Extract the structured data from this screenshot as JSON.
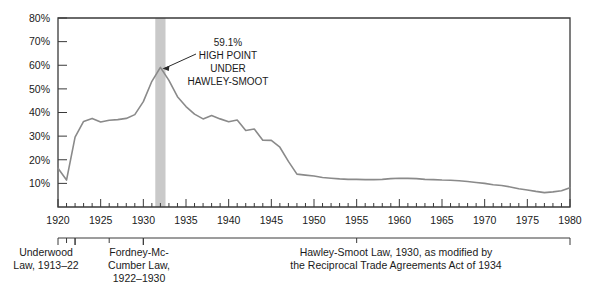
{
  "chart_data": {
    "type": "line",
    "title": "",
    "xlabel": "",
    "ylabel": "",
    "xlim": [
      1920,
      1980
    ],
    "ylim": [
      0,
      80
    ],
    "grid": false,
    "legend": "none",
    "y_ticks": [
      "10%",
      "20%",
      "30%",
      "40%",
      "50%",
      "60%",
      "70%",
      "80%"
    ],
    "y_tick_values": [
      10,
      20,
      30,
      40,
      50,
      60,
      70,
      80
    ],
    "x_ticks": [
      "1920",
      "1925",
      "1930",
      "1935",
      "1940",
      "1945",
      "1950",
      "1955",
      "1960",
      "1965",
      "1970",
      "1975",
      "1980"
    ],
    "x_tick_values": [
      1920,
      1925,
      1930,
      1935,
      1940,
      1945,
      1950,
      1955,
      1960,
      1965,
      1970,
      1975,
      1980
    ],
    "series": [
      {
        "name": "Average tariff rate on dutiable imports",
        "color": "#8a8a8a",
        "x": [
          1920,
          1921,
          1922,
          1923,
          1924,
          1925,
          1926,
          1927,
          1928,
          1929,
          1930,
          1931,
          1932,
          1933,
          1934,
          1935,
          1936,
          1937,
          1938,
          1939,
          1940,
          1941,
          1942,
          1943,
          1944,
          1945,
          1946,
          1947,
          1948,
          1949,
          1950,
          1951,
          1952,
          1953,
          1954,
          1955,
          1956,
          1957,
          1958,
          1959,
          1960,
          1961,
          1962,
          1963,
          1964,
          1965,
          1966,
          1967,
          1968,
          1969,
          1970,
          1971,
          1972,
          1973,
          1974,
          1975,
          1976,
          1977,
          1978,
          1979,
          1980
        ],
        "y": [
          16.4,
          11.4,
          29.6,
          36.2,
          37.5,
          36.0,
          36.7,
          37.0,
          37.5,
          39.1,
          44.6,
          53.2,
          59.1,
          53.6,
          46.7,
          42.5,
          39.3,
          37.3,
          38.7,
          37.3,
          36.1,
          36.8,
          32.4,
          33.0,
          28.3,
          28.2,
          25.3,
          19.3,
          13.9,
          13.5,
          13.1,
          12.5,
          12.2,
          11.9,
          11.7,
          11.7,
          11.6,
          11.6,
          11.7,
          12.0,
          12.2,
          12.1,
          12.0,
          11.7,
          11.6,
          11.4,
          11.3,
          11.1,
          10.8,
          10.4,
          10.0,
          9.4,
          9.1,
          8.5,
          7.7,
          7.2,
          6.6,
          6.1,
          6.4,
          6.9,
          8.2
        ]
      }
    ],
    "annotations": [
      {
        "name": "peak-callout",
        "lines": [
          "59.1%",
          "HIGH  POINT",
          "UNDER",
          "HAWLEY-SMOOT"
        ],
        "point_x": 1932,
        "point_y": 59.1
      }
    ],
    "shaded_band": {
      "name": "hawley-smoot-band",
      "from": 1931.4,
      "to": 1932.6,
      "color": "#c9c9c9"
    }
  },
  "captions": [
    {
      "name": "underwood-law",
      "lines": [
        "Underwood",
        "Law, 1913–22"
      ],
      "bracket_from": 1920,
      "bracket_to": 1922
    },
    {
      "name": "fordney-mccumber-law",
      "lines": [
        "Fordney-Mc-",
        "Cumber Law,",
        "1922–1930"
      ],
      "bracket_from": 1922,
      "bracket_to": 1930
    },
    {
      "name": "hawley-smoot-law",
      "lines": [
        "Hawley-Smoot Law, 1930, as modified by",
        "the Reciprocal Trade Agreements Act of 1934"
      ],
      "bracket_from": 1930,
      "bracket_to": 1980
    }
  ],
  "colors": {
    "line": "#8a8a8a",
    "axis": "#3a3a3a",
    "band": "#c9c9c9",
    "text": "#1a1a1a"
  }
}
